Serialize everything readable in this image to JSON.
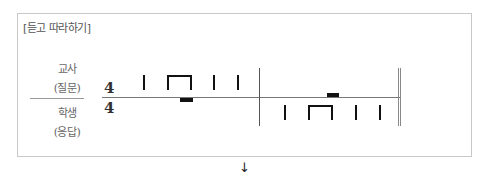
{
  "title": "[듣고 따라하기]",
  "roles": {
    "teacher": {
      "line1": "교사",
      "line2": "(질문)"
    },
    "student": {
      "line1": "학생",
      "line2": "(응답)"
    }
  },
  "time_signature": {
    "numerator": "4",
    "denominator": "4"
  },
  "rhythm": {
    "measure1_teacher": [
      "quarter",
      "eighth-pair",
      "quarter",
      "quarter"
    ],
    "measure1_student": [
      "rest"
    ],
    "measure2_teacher": [
      "rest"
    ],
    "measure2_student": [
      "quarter",
      "eighth-pair",
      "quarter",
      "quarter"
    ]
  },
  "arrow": "↓"
}
